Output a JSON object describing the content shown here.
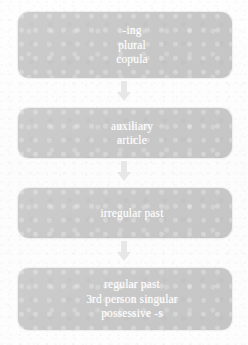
{
  "diagram": {
    "background_color": "#fdfdfd",
    "node_fill_color": "#c8c8c8",
    "node_text_color": "#ffffff",
    "arrow_color": "#e7e7e7",
    "nodes": [
      {
        "id": "node-0",
        "lines": [
          "-ing",
          "plural",
          "copula"
        ]
      },
      {
        "id": "node-1",
        "lines": [
          "auxiliary",
          "article"
        ]
      },
      {
        "id": "node-2",
        "lines": [
          "irregular past"
        ]
      },
      {
        "id": "node-3",
        "lines": [
          "regular past",
          "3rd person singular",
          "possessive -s"
        ]
      }
    ],
    "connectors": [
      {
        "id": "connector-0",
        "icon": "arrow-down-icon",
        "from": "node-0",
        "to": "node-1"
      },
      {
        "id": "connector-1",
        "icon": "arrow-down-icon",
        "from": "node-1",
        "to": "node-2"
      },
      {
        "id": "connector-2",
        "icon": "arrow-down-icon",
        "from": "node-2",
        "to": "node-3"
      }
    ]
  }
}
